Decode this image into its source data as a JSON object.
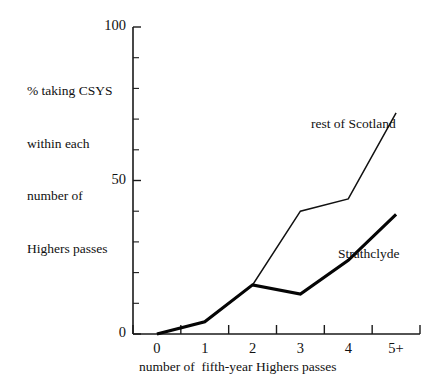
{
  "chart_data": {
    "type": "line",
    "title": "",
    "xlabel": "number of  fifth-year Highers passes",
    "ylabel": "% taking CSYS within each number of Highers passes",
    "categories": [
      "0",
      "1",
      "2",
      "3",
      "4",
      "5+"
    ],
    "xlim": [
      0,
      5
    ],
    "ylim": [
      0,
      100
    ],
    "yticks": [
      0,
      50,
      100
    ],
    "ytick_labels": [
      "0",
      "50",
      "100"
    ],
    "yticks_minor": [
      10,
      20,
      30,
      40,
      60,
      70,
      80,
      90
    ],
    "grid": false,
    "legend": "inline-annotations",
    "series": [
      {
        "name": "rest of Scotland",
        "values": [
          0,
          4,
          16,
          40,
          44,
          72
        ],
        "style": "thin"
      },
      {
        "name": "Strathclyde",
        "values": [
          0,
          4,
          16,
          13,
          24,
          39
        ],
        "style": "thick"
      }
    ],
    "annotations": [
      {
        "text": "rest of Scotland",
        "series": "rest of Scotland"
      },
      {
        "text": "Strathclyde",
        "series": "Strathclyde"
      }
    ]
  },
  "axis": {
    "y_label_lines": [
      "% taking CSYS",
      "within each",
      "number of",
      "Highers passes"
    ],
    "y_tick_labels": [
      "100",
      "50",
      "0"
    ],
    "x_tick_labels": [
      "0",
      "1",
      "2",
      "3",
      "4",
      "5+"
    ],
    "x_caption": "number of  fifth-year Highers passes"
  },
  "colors": {
    "ink": "#111111",
    "background": "#ffffff"
  }
}
